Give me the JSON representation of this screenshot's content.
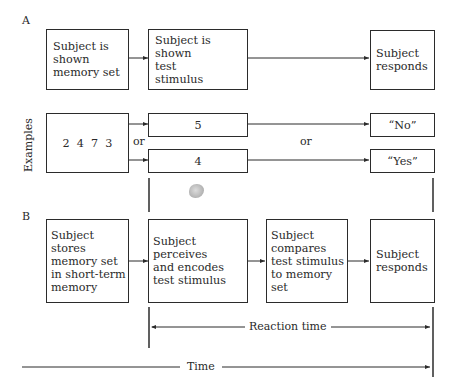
{
  "panel_a": {
    "label": "A",
    "boxes": [
      {
        "text": "Subject is\nshown\nmemory set"
      },
      {
        "text": "Subject is shown\ntest\nstimulus"
      },
      {
        "text": "Subject\nresponds"
      }
    ]
  },
  "examples": {
    "label": "Examples",
    "memory_set": "2  4  7  3",
    "or_left": "or",
    "or_right": "or",
    "stimuli": [
      "5",
      "4"
    ],
    "responses": [
      "“No”",
      "“Yes”"
    ]
  },
  "panel_b": {
    "label": "B",
    "boxes": [
      {
        "text": "Subject stores\nmemory set\nin short-term\nmemory"
      },
      {
        "text": "Subject perceives\nand encodes\ntest stimulus"
      },
      {
        "text": "Subject\ncompares\ntest stimulus\nto memory set"
      },
      {
        "text": "Subject\nresponds"
      }
    ]
  },
  "timeline": {
    "reaction_time_label": "Reaction time",
    "time_label": "Time"
  }
}
